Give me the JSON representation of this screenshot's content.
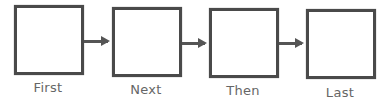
{
  "diagram": {
    "type": "sequence-flow",
    "steps": [
      {
        "label": "First"
      },
      {
        "label": "Next"
      },
      {
        "label": "Then"
      },
      {
        "label": "Last"
      }
    ],
    "colors": {
      "box_border": "#4a4a4a",
      "arrow": "#555555",
      "label": "#666666"
    }
  }
}
